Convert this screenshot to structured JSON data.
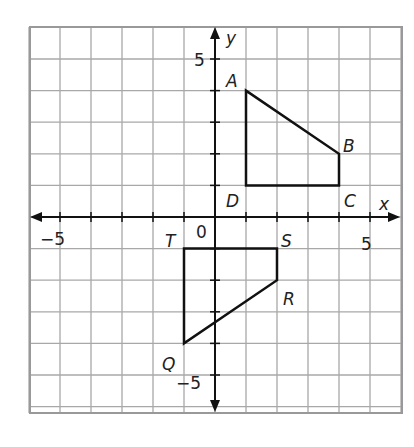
{
  "axes": {
    "x_label": "x",
    "y_label": "y",
    "x_range": [
      -6,
      6
    ],
    "y_range": [
      -6,
      6
    ],
    "origin_label": "0",
    "tick_labels": {
      "x_neg": "−5",
      "x_pos": "5",
      "y_pos": "5",
      "y_neg": "−5"
    }
  },
  "figures": [
    {
      "name": "ABCD",
      "vertices": [
        {
          "label": "A",
          "x": 1,
          "y": 4
        },
        {
          "label": "B",
          "x": 4,
          "y": 2
        },
        {
          "label": "C",
          "x": 4,
          "y": 1
        },
        {
          "label": "D",
          "x": 1,
          "y": 1
        }
      ]
    },
    {
      "name": "QRST",
      "vertices": [
        {
          "label": "T",
          "x": -1,
          "y": -1
        },
        {
          "label": "S",
          "x": 2,
          "y": -1
        },
        {
          "label": "R",
          "x": 2,
          "y": -2
        },
        {
          "label": "Q",
          "x": -1,
          "y": -4
        }
      ]
    }
  ],
  "colors": {
    "grid": "#a8a8a8",
    "border": "#999999",
    "axis": "#111111",
    "shape": "#111111"
  }
}
